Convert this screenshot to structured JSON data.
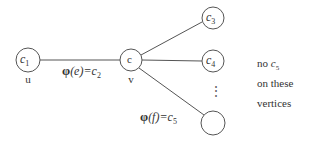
{
  "diagram": {
    "nodes": [
      {
        "id": "u",
        "label": "c",
        "sub": "1",
        "name": "u",
        "cx": 28,
        "cy": 60,
        "r": 12
      },
      {
        "id": "v",
        "label": "c",
        "sub": "",
        "name": "v",
        "cx": 131,
        "cy": 60,
        "r": 11
      },
      {
        "id": "n3",
        "label": "c",
        "sub": "3",
        "name": "",
        "cx": 213,
        "cy": 18,
        "r": 11
      },
      {
        "id": "n4",
        "label": "c",
        "sub": "4",
        "name": "",
        "cx": 213,
        "cy": 61,
        "r": 11
      },
      {
        "id": "n5",
        "label": "",
        "sub": "",
        "name": "",
        "cx": 213,
        "cy": 123,
        "r": 12
      }
    ],
    "edges": [
      {
        "from": "u",
        "to": "v",
        "label": "φ(e)=c₂"
      },
      {
        "from": "v",
        "to": "n3",
        "label": ""
      },
      {
        "from": "v",
        "to": "n4",
        "label": ""
      },
      {
        "from": "v",
        "to": "n5",
        "label": "φ(f)=c₅"
      }
    ],
    "edge_labels": {
      "e_phi": "φ",
      "e_arg": "(e)",
      "e_eq": "=c",
      "e_sub": "2",
      "f_phi": "φ",
      "f_arg": "(f)",
      "f_eq": "=c",
      "f_sub": "5"
    },
    "vertex_names": {
      "u": "u",
      "v": "v"
    },
    "node_labels": {
      "u_main": "c",
      "u_sub": "1",
      "v_main": "c",
      "n3_main": "c",
      "n3_sub": "3",
      "n4_main": "c",
      "n4_sub": "4"
    },
    "ellipsis": "⋮",
    "annotation": {
      "line1_word": "no",
      "line1_var": "c",
      "line1_sub": "5",
      "line2": "on these",
      "line3": "vertices"
    }
  }
}
